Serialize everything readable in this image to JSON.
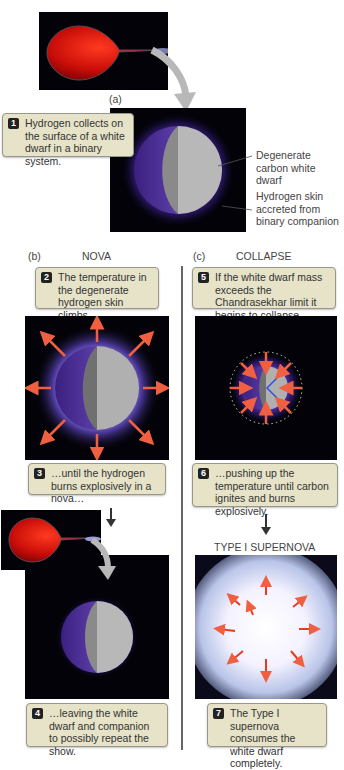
{
  "panel_a": {
    "label": "(a)",
    "caption_num": "1",
    "caption": "Hydrogen collects on the surface of a white dwarf in a binary system.",
    "annotation_1": "Degenerate carbon white dwarf",
    "annotation_2": "Hydrogen skin accreted from binary companion"
  },
  "panel_b": {
    "label": "(b)",
    "title": "NOVA",
    "step2_num": "2",
    "step2": "The temperature in the degenerate hydrogen skin climbs…",
    "step3_num": "3",
    "step3": "…until the hydrogen burns explosively in a nova…",
    "step4_num": "4",
    "step4": "…leaving the white dwarf and companion to possibly repeat the show."
  },
  "panel_c": {
    "label": "(c)",
    "title": "COLLAPSE",
    "step5_num": "5",
    "step5": "If the white dwarf mass exceeds the Chandrasekhar limit it begins to collapse…",
    "step6_num": "6",
    "step6": "…pushing up the temperature until carbon ignites and burns explosively.",
    "supernova_title": "TYPE I SUPERNOVA",
    "step7_num": "7",
    "step7": "The Type I supernova consumes the white dwarf completely."
  },
  "colors": {
    "caption_bg": "#e6e3c8",
    "red_giant": "#d11a10",
    "hydrogen_glow": "#6a3fd0",
    "arrow_orange": "#f06040",
    "space": "#020208"
  }
}
